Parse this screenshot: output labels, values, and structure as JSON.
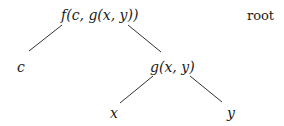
{
  "tree": {
    "root_label": "root",
    "nodes": {
      "root": "f(c, g(x, y))",
      "c": "c",
      "g": "g(x, y)",
      "x": "x",
      "y": "y"
    },
    "edges": [
      [
        "f(c, g(x, y))",
        "c"
      ],
      [
        "f(c, g(x, y))",
        "g(x, y)"
      ],
      [
        "g(x, y)",
        "x"
      ],
      [
        "g(x, y)",
        "y"
      ]
    ]
  }
}
